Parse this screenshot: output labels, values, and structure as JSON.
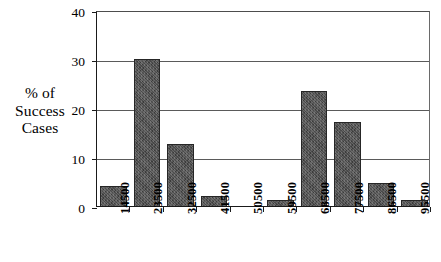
{
  "chart_data": {
    "type": "bar",
    "title": "",
    "subtitle": "",
    "xlabel": "",
    "ylabel": "% of Success Cases",
    "ylabel_lines": [
      "% of",
      "Success",
      "Cases"
    ],
    "categories": [
      "14500",
      "23500",
      "32500",
      "41500",
      "50500",
      "59500",
      "68500",
      "77500",
      "86500",
      "95500"
    ],
    "values": [
      4.0,
      30.0,
      12.7,
      2.1,
      0.0,
      1.2,
      23.5,
      17.2,
      4.7,
      1.2
    ],
    "ylim": [
      0,
      40
    ],
    "yticks": [
      0,
      10,
      20,
      30,
      40
    ],
    "ytick_labels": [
      "0",
      "10",
      "20",
      "30",
      "40"
    ],
    "grid": true,
    "grid_axis": "y",
    "legend": false,
    "legend_position": "none",
    "bar_color": "#4c4c4c",
    "bar_edge_color": "#262626",
    "axis_color": "#1a1a1a",
    "grid_color": "#5a5a5a",
    "background_color": "#ffffff",
    "xtick_label_rotation": 90
  }
}
